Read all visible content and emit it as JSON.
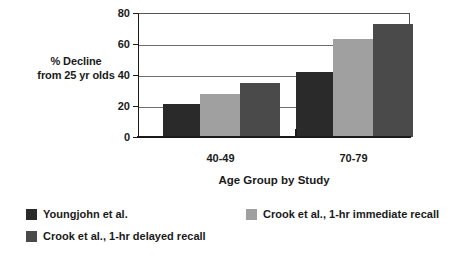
{
  "chart_data": {
    "type": "bar",
    "title": "",
    "subtitle": "",
    "xlabel": "Age Group by Study",
    "ylabel_lines": [
      "% Decline",
      "from 25 yr olds"
    ],
    "ylabel": "% Decline from 25 yr olds",
    "categories": [
      "40-49",
      "70-79"
    ],
    "ylim": [
      0,
      80
    ],
    "yticks": [
      0,
      20,
      40,
      60,
      80
    ],
    "ytick_labels": [
      "0",
      "20",
      "40",
      "60",
      "80"
    ],
    "grid": true,
    "grid_axis": "y",
    "legend_position": "below-plot",
    "series": [
      {
        "name": "Youngjohn et al.",
        "color": "#2a2a2a",
        "values": [
          21,
          42
        ]
      },
      {
        "name": "Crook et al., 1-hr immediate recall",
        "color": "#a0a0a0",
        "values": [
          28,
          63
        ]
      },
      {
        "name": "Crook et al., 1-hr delayed recall",
        "color": "#4a4a4a",
        "values": [
          35,
          73
        ]
      }
    ],
    "annotations": []
  },
  "colors": {
    "background": "#ffffff",
    "axis": "#1a1a1a",
    "gridline": "#6e6e6e",
    "text": "#1a1a1a"
  }
}
